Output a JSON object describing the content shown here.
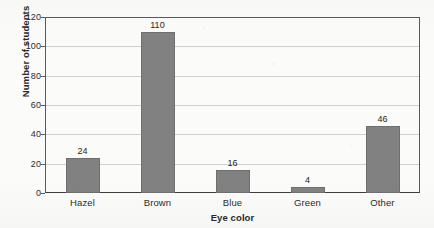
{
  "chart_data": {
    "type": "bar",
    "title": "",
    "subtitle": "",
    "xlabel": "Eye color",
    "ylabel": "Number of students",
    "categories": [
      "Hazel",
      "Brown",
      "Blue",
      "Green",
      "Other"
    ],
    "values": [
      24,
      110,
      16,
      4,
      46
    ],
    "value_labels": [
      "24",
      "110",
      "16",
      "4",
      "46"
    ],
    "ylim": [
      0,
      120
    ],
    "y_ticks": [
      0,
      20,
      40,
      60,
      80,
      100,
      120
    ],
    "y_tick_labels": [
      "0",
      "20",
      "40",
      "60",
      "80",
      "100",
      "120"
    ],
    "grid": "horizontal",
    "legend": "none",
    "bar_color": "#818181",
    "gridline_color": "#cfcfcf",
    "axis_color": "#5a5a5a",
    "background_color": "#fbfbfa",
    "text_color": "#2b2b2b"
  }
}
